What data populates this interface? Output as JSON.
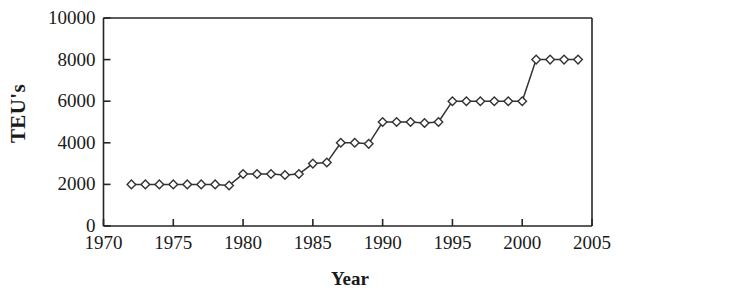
{
  "chart_data": {
    "type": "line",
    "title": "",
    "xlabel": "Year",
    "ylabel": "TEU's",
    "xlim": [
      1970,
      2005
    ],
    "ylim": [
      0,
      10000
    ],
    "xticks": [
      1970,
      1975,
      1980,
      1985,
      1990,
      1995,
      2000,
      2005
    ],
    "yticks": [
      0,
      2000,
      4000,
      6000,
      8000,
      10000
    ],
    "grid": false,
    "legend": null,
    "marker": "open-diamond",
    "line_color": "#333333",
    "marker_face_color": "#ffffff",
    "x": [
      1972,
      1973,
      1974,
      1975,
      1976,
      1977,
      1978,
      1979,
      1980,
      1981,
      1982,
      1983,
      1984,
      1985,
      1986,
      1987,
      1988,
      1989,
      1990,
      1991,
      1992,
      1993,
      1994,
      1995,
      1996,
      1997,
      1998,
      1999,
      2000,
      2001,
      2002,
      2003,
      2004
    ],
    "values": [
      2000,
      2000,
      2000,
      2000,
      2000,
      2000,
      2000,
      1950,
      2500,
      2500,
      2500,
      2450,
      2500,
      3000,
      3050,
      4000,
      4000,
      3950,
      5000,
      5000,
      5000,
      4950,
      5000,
      6000,
      6000,
      6000,
      6000,
      6000,
      6000,
      8000,
      8000,
      8000,
      8000
    ]
  },
  "axis": {
    "ylabel_text": "TEU's",
    "xlabel_text": "Year",
    "ytick_labels": [
      "10000",
      "8000",
      "6000",
      "4000",
      "2000",
      "0"
    ],
    "xtick_labels": [
      "1970",
      "1975",
      "1980",
      "1985",
      "1990",
      "1995",
      "2000",
      "2005"
    ]
  }
}
